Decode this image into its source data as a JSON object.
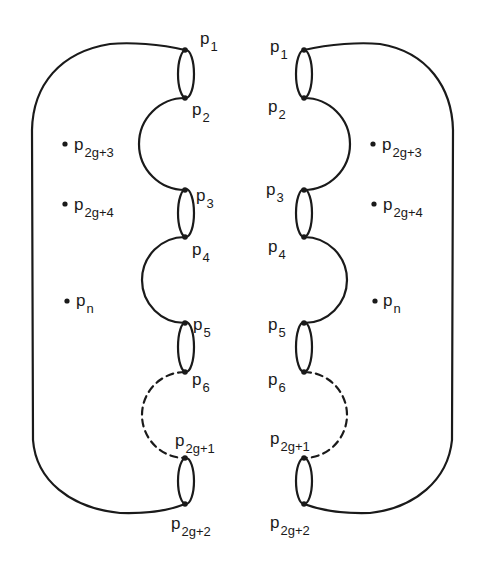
{
  "diagram": {
    "type": "surface-decomposition",
    "left": {
      "boundary_points": [
        {
          "label": "p",
          "sub": "1",
          "x": 185,
          "y": 50,
          "lx": 200,
          "ly": 44
        },
        {
          "label": "p",
          "sub": "2",
          "x": 185,
          "y": 98,
          "lx": 192,
          "ly": 115
        },
        {
          "label": "p",
          "sub": "3",
          "x": 185,
          "y": 190,
          "lx": 196,
          "ly": 201
        },
        {
          "label": "p",
          "sub": "4",
          "x": 185,
          "y": 237,
          "lx": 192,
          "ly": 255
        },
        {
          "label": "p",
          "sub": "5",
          "x": 185,
          "y": 323,
          "lx": 193,
          "ly": 330
        },
        {
          "label": "p",
          "sub": "6",
          "x": 185,
          "y": 372,
          "lx": 192,
          "ly": 385
        },
        {
          "label": "p",
          "sub": "2g+1",
          "x": 185,
          "y": 458,
          "lx": 175,
          "ly": 446
        },
        {
          "label": "p",
          "sub": "2g+2",
          "x": 185,
          "y": 504,
          "lx": 171,
          "ly": 529
        }
      ],
      "interior_points": [
        {
          "label": "p",
          "sub": "2g+3",
          "x": 65,
          "y": 144,
          "lx": 74,
          "ly": 150
        },
        {
          "label": "p",
          "sub": "2g+4",
          "x": 65,
          "y": 204,
          "lx": 74,
          "ly": 210
        },
        {
          "label": "p",
          "sub": "n",
          "x": 67,
          "y": 301,
          "lx": 76,
          "ly": 306
        }
      ]
    },
    "right": {
      "boundary_points": [
        {
          "label": "p",
          "sub": "1",
          "x": 304,
          "y": 50,
          "lx": 270,
          "ly": 52
        },
        {
          "label": "p",
          "sub": "2",
          "x": 304,
          "y": 98,
          "lx": 268,
          "ly": 112
        },
        {
          "label": "p",
          "sub": "3",
          "x": 304,
          "y": 190,
          "lx": 266,
          "ly": 195
        },
        {
          "label": "p",
          "sub": "4",
          "x": 304,
          "y": 237,
          "lx": 268,
          "ly": 252
        },
        {
          "label": "p",
          "sub": "5",
          "x": 304,
          "y": 323,
          "lx": 268,
          "ly": 330
        },
        {
          "label": "p",
          "sub": "6",
          "x": 304,
          "y": 372,
          "lx": 268,
          "ly": 385
        },
        {
          "label": "p",
          "sub": "2g+1",
          "x": 304,
          "y": 458,
          "lx": 270,
          "ly": 444
        },
        {
          "label": "p",
          "sub": "2g+2",
          "x": 304,
          "y": 504,
          "lx": 270,
          "ly": 528
        }
      ],
      "interior_points": [
        {
          "label": "p",
          "sub": "2g+3",
          "x": 373,
          "y": 144,
          "lx": 382,
          "ly": 150
        },
        {
          "label": "p",
          "sub": "2g+4",
          "x": 374,
          "y": 204,
          "lx": 383,
          "ly": 210
        },
        {
          "label": "p",
          "sub": "n",
          "x": 375,
          "y": 301,
          "lx": 383,
          "ly": 306
        }
      ]
    },
    "colors": {
      "ink": "#1a1a1a",
      "background": "#ffffff"
    }
  }
}
